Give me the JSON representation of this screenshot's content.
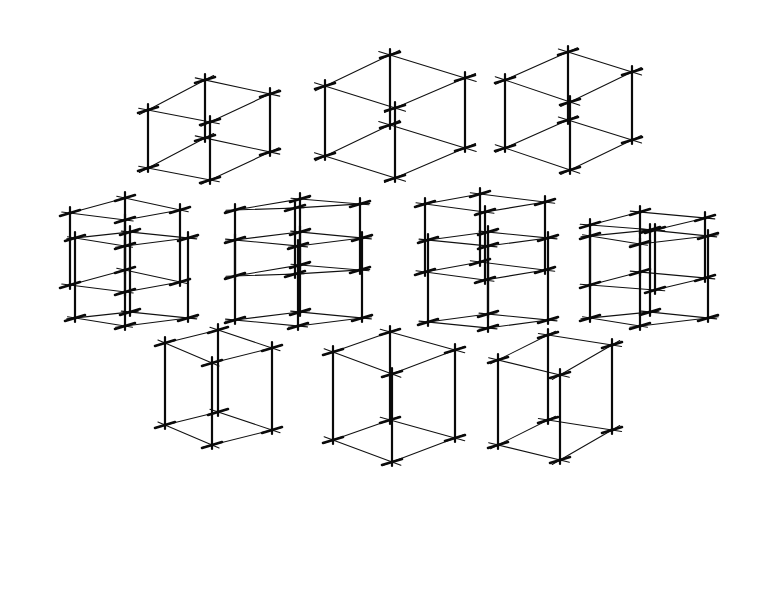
{
  "artwork": {
    "description": "Hand-drawn ink sketch of wireframe cubes seen from varying viewpoints",
    "ink_color": "#111111",
    "background": "#ffffff",
    "rows": [
      {
        "name": "row-1-viewed-from-above",
        "cubes": [
          {
            "front": [
              150,
              168
            ],
            "left": [
              150,
              110
            ],
            "w": [
              48,
              -28
            ],
            "d": [
              62,
              0
            ],
            "h": 60,
            "view": "above",
            "fx": 148,
            "fy": 168
          },
          {
            "fx": 328,
            "fy": 158,
            "view": "above"
          },
          {
            "fx": 508,
            "fy": 148,
            "view": "above"
          }
        ]
      },
      {
        "name": "row-2-eye-level-above",
        "cubes": [
          {},
          {},
          {},
          {}
        ]
      },
      {
        "name": "row-3-eye-level-below",
        "cubes": [
          {},
          {},
          {},
          {}
        ]
      },
      {
        "name": "row-4-viewed-from-below",
        "cubes": [
          {},
          {},
          {}
        ]
      }
    ],
    "cube_count": 14
  },
  "cubes": [
    {
      "a": [
        148,
        168
      ],
      "b": [
        210,
        180
      ],
      "c": [
        270,
        152
      ],
      "d": [
        205,
        138
      ],
      "h": 58
    },
    {
      "a": [
        325,
        156
      ],
      "b": [
        395,
        178
      ],
      "c": [
        465,
        148
      ],
      "d": [
        390,
        125
      ],
      "h": 70
    },
    {
      "a": [
        505,
        148
      ],
      "b": [
        570,
        170
      ],
      "c": [
        632,
        140
      ],
      "d": [
        568,
        120
      ],
      "h": 68
    },
    {
      "a": [
        70,
        285
      ],
      "b": [
        125,
        292
      ],
      "c": [
        180,
        282
      ],
      "d": [
        125,
        270
      ],
      "h": 72
    },
    {
      "a": [
        235,
        276
      ],
      "b": [
        295,
        274
      ],
      "c": [
        360,
        270
      ],
      "d": [
        300,
        265
      ],
      "h": 66
    },
    {
      "a": [
        425,
        272
      ],
      "b": [
        485,
        280
      ],
      "c": [
        545,
        270
      ],
      "d": [
        480,
        262
      ],
      "h": 68
    },
    {
      "a": [
        590,
        285
      ],
      "b": [
        655,
        290
      ],
      "c": [
        705,
        278
      ],
      "d": [
        640,
        272
      ],
      "h": 60
    },
    {
      "a": [
        75,
        318
      ],
      "b": [
        125,
        326
      ],
      "c": [
        188,
        318
      ],
      "d": [
        130,
        312
      ],
      "h": 80,
      "below": true
    },
    {
      "a": [
        235,
        320
      ],
      "b": [
        298,
        326
      ],
      "c": [
        362,
        318
      ],
      "d": [
        300,
        312
      ],
      "h": 80,
      "below": true
    },
    {
      "a": [
        428,
        322
      ],
      "b": [
        488,
        328
      ],
      "c": [
        548,
        320
      ],
      "d": [
        488,
        314
      ],
      "h": 82,
      "below": true
    },
    {
      "a": [
        590,
        318
      ],
      "b": [
        640,
        326
      ],
      "c": [
        708,
        318
      ],
      "d": [
        650,
        312
      ],
      "h": 82,
      "below": true
    },
    {
      "a": [
        165,
        425
      ],
      "b": [
        212,
        445
      ],
      "c": [
        272,
        430
      ],
      "d": [
        218,
        412
      ],
      "h": 82,
      "below": true
    },
    {
      "a": [
        333,
        440
      ],
      "b": [
        392,
        462
      ],
      "c": [
        455,
        438
      ],
      "d": [
        390,
        420
      ],
      "h": 88,
      "below": true
    },
    {
      "a": [
        498,
        445
      ],
      "b": [
        560,
        460
      ],
      "c": [
        612,
        430
      ],
      "d": [
        548,
        420
      ],
      "h": 85,
      "below": true
    }
  ]
}
